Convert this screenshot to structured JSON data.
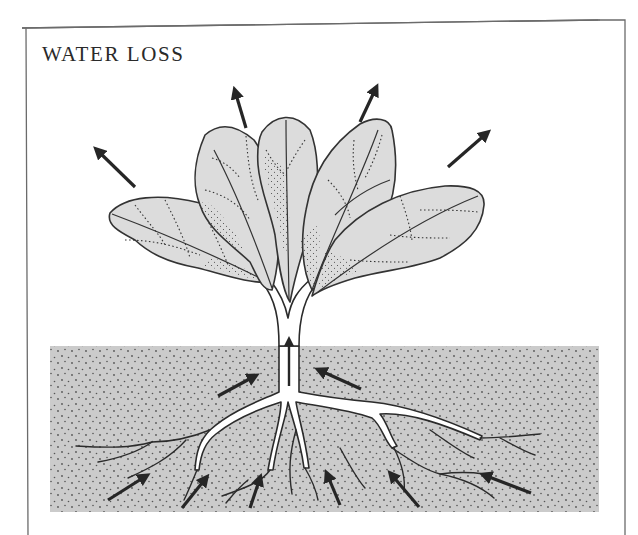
{
  "title": "WATER LOSS",
  "colors": {
    "frame": "#6b6b6b",
    "soil": "#cbcbcb",
    "soil_dots": "#555555",
    "leaf_fill": "#dcdcdc",
    "leaf_outline": "#3a3a3a",
    "arrow": "#262626",
    "root_fill": "#ffffff"
  },
  "diagram": {
    "regions": [
      "air",
      "leaves",
      "stem",
      "soil",
      "roots"
    ],
    "arrows": {
      "transpiration_out_of_leaves": 4,
      "water_up_stem": 1,
      "water_into_upper_roots": 2,
      "water_into_lower_roots": 6
    }
  }
}
